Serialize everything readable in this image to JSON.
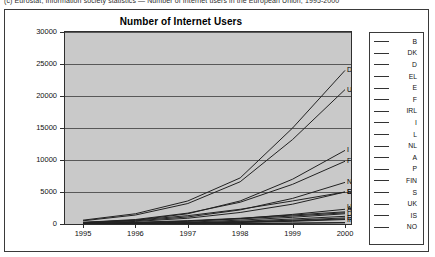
{
  "top_caption": "(c) Eurostat, Information society statistics — Number of Internet users in the European Union, 1995-2000",
  "figure": {
    "title": "Number of Internet Users"
  },
  "chart_data": {
    "type": "line",
    "title": "Number of Internet Users",
    "xlabel": "",
    "ylabel": "",
    "x": [
      1995,
      1996,
      1997,
      1998,
      1999,
      2000
    ],
    "xtick_labels": [
      "1995",
      "1996",
      "1997",
      "1998",
      "1999",
      "2000"
    ],
    "ytick_labels": [
      "0",
      "5000",
      "10000",
      "15000",
      "20000",
      "25000",
      "30000"
    ],
    "ylim": [
      0,
      30000
    ],
    "ytick_step": 5000,
    "grid": "horizontal",
    "legend_position": "right-outside-box",
    "plot_background": "#c9c9c9",
    "line_color": "#222222",
    "series": [
      {
        "name": "B",
        "label": "B",
        "values": [
          40,
          90,
          200,
          420,
          780,
          1200
        ]
      },
      {
        "name": "DK",
        "label": "DK",
        "values": [
          60,
          130,
          290,
          600,
          1050,
          1600
        ]
      },
      {
        "name": "D",
        "label": "D",
        "values": [
          600,
          1600,
          3600,
          7200,
          15000,
          24000
        ]
      },
      {
        "name": "EL",
        "label": "EL",
        "values": [
          20,
          50,
          110,
          230,
          420,
          700
        ]
      },
      {
        "name": "E",
        "label": "E",
        "values": [
          150,
          400,
          900,
          1800,
          3100,
          5000
        ]
      },
      {
        "name": "F",
        "label": "F",
        "values": [
          250,
          700,
          1700,
          3400,
          6200,
          9800
        ]
      },
      {
        "name": "IRL",
        "label": "IRL",
        "values": [
          25,
          60,
          140,
          280,
          500,
          800
        ]
      },
      {
        "name": "I",
        "label": "I",
        "values": [
          200,
          600,
          1600,
          3600,
          7000,
          11500
        ]
      },
      {
        "name": "L",
        "label": "L",
        "values": [
          5,
          12,
          28,
          60,
          110,
          180
        ]
      },
      {
        "name": "NL",
        "label": "NL",
        "values": [
          200,
          500,
          1100,
          2200,
          4000,
          6500
        ]
      },
      {
        "name": "A",
        "label": "A",
        "values": [
          80,
          190,
          420,
          850,
          1500,
          2300
        ]
      },
      {
        "name": "P",
        "label": "P",
        "values": [
          30,
          70,
          160,
          330,
          600,
          950
        ]
      },
      {
        "name": "FIN",
        "label": "FIN",
        "values": [
          120,
          260,
          520,
          900,
          1400,
          1900
        ]
      },
      {
        "name": "S",
        "label": "S",
        "values": [
          250,
          600,
          1300,
          2300,
          3600,
          5000
        ]
      },
      {
        "name": "UK",
        "label": "UK",
        "values": [
          500,
          1400,
          3200,
          6600,
          13200,
          21000
        ]
      },
      {
        "name": "IS",
        "label": "IS",
        "values": [
          8,
          18,
          40,
          80,
          145,
          230
        ]
      },
      {
        "name": "NO",
        "label": "NO",
        "values": [
          90,
          210,
          450,
          800,
          1250,
          1750
        ]
      }
    ],
    "end_labels": [
      {
        "text": "D",
        "value": 24000
      },
      {
        "text": "UK",
        "value": 21000
      },
      {
        "text": "I",
        "value": 11500
      },
      {
        "text": "F",
        "value": 9800
      },
      {
        "text": "NL",
        "value": 6500
      },
      {
        "text": "E",
        "value": 5000
      },
      {
        "text": "S",
        "value": 5000
      },
      {
        "text": "UK",
        "value": 2700
      },
      {
        "text": "A",
        "value": 2300
      },
      {
        "text": "DK",
        "value": 1600
      },
      {
        "text": "EL",
        "value": 1000
      },
      {
        "text": "IRL",
        "value": 700
      }
    ]
  },
  "legend": {
    "items": [
      {
        "label": "B"
      },
      {
        "label": "DK"
      },
      {
        "label": "D"
      },
      {
        "label": "EL"
      },
      {
        "label": "E"
      },
      {
        "label": "F"
      },
      {
        "label": "IRL"
      },
      {
        "label": "I"
      },
      {
        "label": "L"
      },
      {
        "label": "NL"
      },
      {
        "label": "A"
      },
      {
        "label": "P"
      },
      {
        "label": "FIN"
      },
      {
        "label": "S"
      },
      {
        "label": "UK"
      },
      {
        "label": "IS"
      },
      {
        "label": "NO"
      }
    ]
  }
}
